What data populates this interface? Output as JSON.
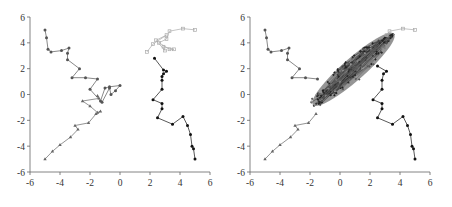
{
  "chart_data": [
    {
      "type": "line",
      "panel": "left",
      "title": "",
      "xlabel": "",
      "ylabel": "",
      "xlim": [
        -6,
        6
      ],
      "ylim": [
        -6,
        6
      ],
      "xticks": [
        -6,
        -4,
        -2,
        0,
        2,
        4,
        6
      ],
      "yticks": [
        -6,
        -4,
        -2,
        0,
        2,
        4,
        6
      ],
      "grid": false,
      "legend": null,
      "series": [
        {
          "name": "trajectory-top-left",
          "color": "#555555",
          "marker": "circle",
          "points": [
            [
              -5,
              5
            ],
            [
              -4.9,
              4.4
            ],
            [
              -4.8,
              3.5
            ],
            [
              -4.6,
              3.3
            ],
            [
              -3.9,
              3.4
            ],
            [
              -3.4,
              3.6
            ],
            [
              -3.5,
              3.2
            ],
            [
              -3.5,
              2.7
            ],
            [
              -2.7,
              2.0
            ],
            [
              -3.2,
              1.3
            ],
            [
              -2.3,
              1.3
            ],
            [
              -1.5,
              1.2
            ],
            [
              -2.0,
              0.4
            ],
            [
              -1.3,
              -0.5
            ],
            [
              -1.0,
              0.5
            ],
            [
              -0.7,
              0.6
            ],
            [
              0.0,
              0.7
            ],
            [
              -0.3,
              0.3
            ],
            [
              -0.6,
              0.0
            ],
            [
              -0.7,
              0.5
            ],
            [
              -1.2,
              -0.6
            ]
          ]
        },
        {
          "name": "trajectory-bottom-left",
          "color": "#666666",
          "marker": "triangle",
          "points": [
            [
              -5,
              -5
            ],
            [
              -4.5,
              -4.4
            ],
            [
              -4.0,
              -3.9
            ],
            [
              -3.3,
              -3.3
            ],
            [
              -2.8,
              -2.7
            ],
            [
              -3.0,
              -2.4
            ],
            [
              -2.1,
              -2.2
            ],
            [
              -1.6,
              -1.5
            ],
            [
              -1.3,
              -1.3
            ],
            [
              -1.5,
              -1.4
            ],
            [
              -2.0,
              -0.9
            ],
            [
              -2.5,
              -0.5
            ],
            [
              -1.4,
              -0.3
            ],
            [
              -1.5,
              -0.1
            ]
          ]
        },
        {
          "name": "trajectory-bottom-right",
          "color": "#111111",
          "marker": "circle",
          "points": [
            [
              5,
              -5
            ],
            [
              4.9,
              -4.2
            ],
            [
              4.8,
              -4.0
            ],
            [
              4.7,
              -3.1
            ],
            [
              4.5,
              -2.4
            ],
            [
              4.2,
              -1.7
            ],
            [
              3.5,
              -2.3
            ],
            [
              2.5,
              -1.8
            ],
            [
              2.8,
              -1.1
            ],
            [
              2.8,
              -0.7
            ],
            [
              2.2,
              -0.4
            ],
            [
              2.8,
              0.4
            ],
            [
              2.8,
              1.1
            ],
            [
              2.8,
              1.4
            ],
            [
              2.9,
              1.6
            ],
            [
              3.1,
              1.8
            ],
            [
              2.9,
              1.9
            ],
            [
              2.3,
              2.8
            ]
          ]
        },
        {
          "name": "trajectory-top-right",
          "color": "#aaaaaa",
          "marker": "square",
          "points": [
            [
              5,
              5
            ],
            [
              4.2,
              5.1
            ],
            [
              3.3,
              4.9
            ],
            [
              3.1,
              4.3
            ],
            [
              2.6,
              4.0
            ],
            [
              3.3,
              3.5
            ],
            [
              3.6,
              3.5
            ],
            [
              2.9,
              3.7
            ],
            [
              3.0,
              3.4
            ],
            [
              2.4,
              4.2
            ],
            [
              3.1,
              4.6
            ],
            [
              2.2,
              3.9
            ],
            [
              1.8,
              3.3
            ]
          ]
        }
      ]
    },
    {
      "type": "line",
      "panel": "right",
      "title": "",
      "xlabel": "",
      "ylabel": "",
      "xlim": [
        -6,
        6
      ],
      "ylim": [
        -6,
        6
      ],
      "xticks": [
        -6,
        -4,
        -2,
        0,
        2,
        4,
        6
      ],
      "yticks": [
        -6,
        -4,
        -2,
        0,
        2,
        4,
        6
      ],
      "grid": false,
      "legend": null,
      "series": [
        {
          "name": "trajectory-top-left",
          "color": "#555555",
          "marker": "circle",
          "points": [
            [
              -5,
              5
            ],
            [
              -4.9,
              4.4
            ],
            [
              -4.8,
              3.5
            ],
            [
              -4.6,
              3.3
            ],
            [
              -3.9,
              3.4
            ],
            [
              -3.4,
              3.6
            ],
            [
              -3.5,
              3.2
            ],
            [
              -3.5,
              2.7
            ],
            [
              -2.7,
              2.0
            ],
            [
              -3.2,
              1.3
            ],
            [
              -2.3,
              1.3
            ],
            [
              -1.5,
              1.2
            ]
          ]
        },
        {
          "name": "trajectory-bottom-left",
          "color": "#666666",
          "marker": "triangle",
          "points": [
            [
              -5,
              -5
            ],
            [
              -4.5,
              -4.4
            ],
            [
              -4.0,
              -3.9
            ],
            [
              -3.3,
              -3.3
            ],
            [
              -2.8,
              -2.7
            ],
            [
              -3.0,
              -2.4
            ],
            [
              -2.1,
              -2.2
            ],
            [
              -1.6,
              -1.5
            ]
          ]
        },
        {
          "name": "trajectory-bottom-right",
          "color": "#111111",
          "marker": "circle",
          "points": [
            [
              5,
              -5
            ],
            [
              4.9,
              -4.2
            ],
            [
              4.8,
              -4.0
            ],
            [
              4.7,
              -3.1
            ],
            [
              4.5,
              -2.4
            ],
            [
              4.2,
              -1.7
            ],
            [
              3.5,
              -2.3
            ],
            [
              2.5,
              -1.8
            ],
            [
              2.8,
              -1.1
            ],
            [
              2.8,
              -0.7
            ],
            [
              2.2,
              -0.4
            ],
            [
              2.8,
              0.4
            ],
            [
              2.8,
              1.1
            ],
            [
              2.9,
              1.6
            ],
            [
              3.1,
              1.8
            ],
            [
              2.5,
              2.2
            ]
          ]
        },
        {
          "name": "trajectory-top-right",
          "color": "#aaaaaa",
          "marker": "square",
          "points": [
            [
              5,
              5
            ],
            [
              4.2,
              5.1
            ],
            [
              3.3,
              4.9
            ],
            [
              3.1,
              4.6
            ]
          ]
        }
      ],
      "dense_cloud": {
        "description": "Dense overlapping trajectories forming an elongated diagonal band",
        "center_line": [
          [
            -1.6,
            -0.6
          ],
          [
            3.4,
            4.5
          ]
        ],
        "width": 1.4,
        "color": "#777777"
      }
    }
  ]
}
